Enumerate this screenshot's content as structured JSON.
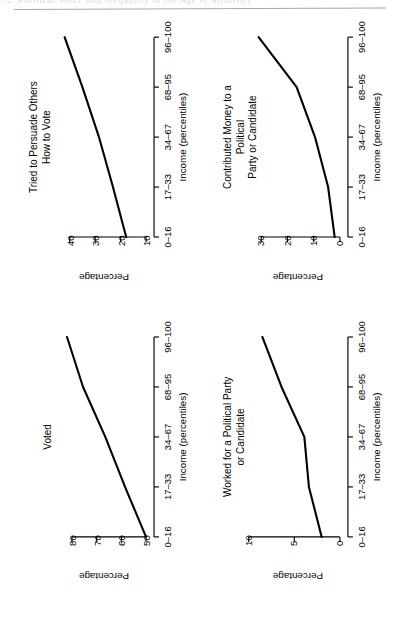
{
  "page": {
    "folio": "72",
    "running_head": "Political Voice and Inequality in the Age of Affluence"
  },
  "figure": {
    "x_axis_title": "Income (percentiles)",
    "y_axis_title": "Percentage",
    "x_categories": [
      "0–16",
      "17–33",
      "34–67",
      "68–95",
      "96–100"
    ]
  },
  "chart_data": [
    {
      "type": "line",
      "title": "Voted",
      "xlabel": "Income (percentiles)",
      "ylabel": "Percentage",
      "categories": [
        "0–16",
        "17–33",
        "34–67",
        "68–95",
        "96–100"
      ],
      "values": [
        50.0,
        58.5,
        66.5,
        75.5,
        82.0
      ],
      "yticks": [
        50,
        60,
        70,
        80
      ],
      "ylim": [
        50,
        84
      ],
      "grid": false,
      "legend": false
    },
    {
      "type": "line",
      "title": "Tried to Persuade Others\nHow to Vote",
      "xlabel": "Income (percentiles)",
      "ylabel": "Percentage",
      "categories": [
        "0–16",
        "17–33",
        "34–67",
        "68–95",
        "96–100"
      ],
      "values": [
        17.8,
        23.0,
        28.5,
        35.0,
        42.0
      ],
      "yticks": [
        10,
        20,
        30,
        40
      ],
      "ylim": [
        10,
        43
      ],
      "grid": false,
      "legend": false
    },
    {
      "type": "line",
      "title": "Worked for a Political Party\nor Candidate",
      "xlabel": "Income (percentiles)",
      "ylabel": "Percentage",
      "categories": [
        "0–16",
        "17–33",
        "34–67",
        "68–95",
        "96–100"
      ],
      "values": [
        2.0,
        3.4,
        3.9,
        6.4,
        8.5
      ],
      "yticks": [
        0,
        5,
        10
      ],
      "ylim": [
        0,
        9.2
      ],
      "grid": false,
      "legend": false
    },
    {
      "type": "line",
      "title": "Contributed Money to a Political\nParty or Candidate",
      "xlabel": "Income (percentiles)",
      "ylabel": "Percentage",
      "categories": [
        "0–16",
        "17–33",
        "34–67",
        "68–95",
        "96–100"
      ],
      "values": [
        2.0,
        4.5,
        9.5,
        16.5,
        31.0
      ],
      "yticks": [
        0,
        10,
        20,
        30
      ],
      "ylim": [
        0,
        32
      ],
      "grid": false,
      "legend": false
    }
  ]
}
